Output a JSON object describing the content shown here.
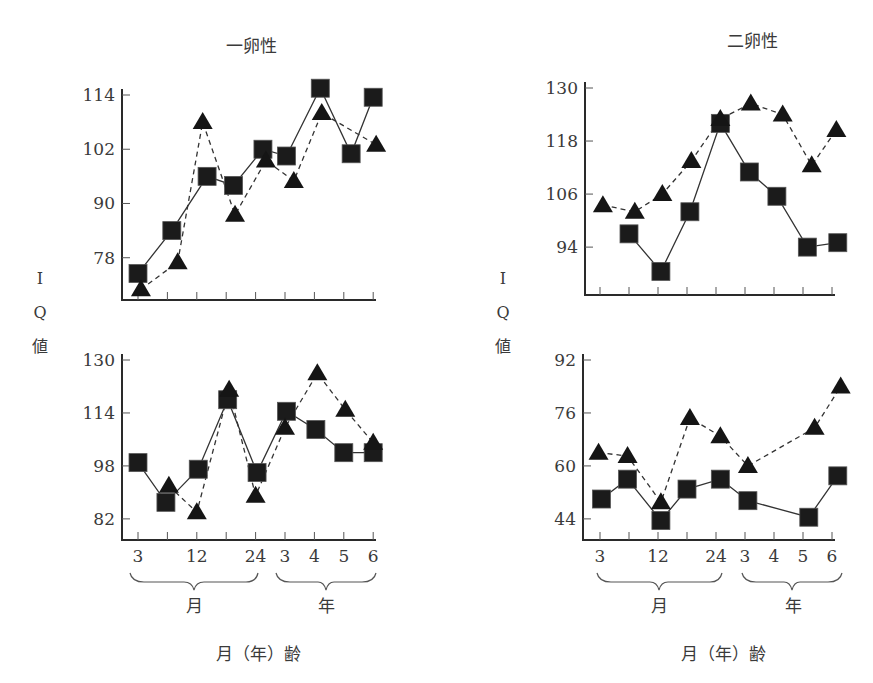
{
  "labels": {
    "ylabel_chars": [
      "I",
      "Q",
      "値"
    ],
    "xlabel": "月（年）齢",
    "group_months": "月",
    "group_years": "年"
  },
  "chart_data": [
    {
      "id": "top-left",
      "type": "line",
      "title": "一卵性",
      "xlabel": "月（年）齢",
      "ylabel": "IQ値",
      "x_tick_labels": [
        "",
        "",
        "",
        "",
        "",
        "",
        "",
        "",
        ""
      ],
      "x_positions": [
        "3m",
        "6m",
        "12m",
        "18m",
        "24m",
        "3y",
        "4y",
        "5y",
        "6y"
      ],
      "yticks": [
        78,
        90,
        102,
        114
      ],
      "ylim": [
        71,
        114
      ],
      "series": [
        {
          "name": "squares (solid)",
          "marker": "square",
          "line": "solid",
          "x": [
            0.0,
            1.15,
            2.35,
            3.25,
            4.25,
            5.05,
            6.2,
            7.25,
            8.0
          ],
          "values": [
            74.5,
            84,
            96,
            94,
            102,
            100.5,
            115.5,
            101,
            113.5
          ]
        },
        {
          "name": "triangles (dashed)",
          "marker": "triangle",
          "line": "dashed",
          "x": [
            0.1,
            1.35,
            2.2,
            3.3,
            4.35,
            5.3,
            6.25,
            8.1
          ],
          "values": [
            71,
            77,
            108,
            87.5,
            99.5,
            95,
            110,
            103
          ]
        }
      ]
    },
    {
      "id": "top-right",
      "type": "line",
      "title": "二卵性",
      "xlabel": "月（年）齢",
      "ylabel": "IQ値",
      "x_tick_labels": [
        "",
        "",
        "",
        "",
        "",
        "",
        "",
        "",
        ""
      ],
      "x_positions": [
        "3m",
        "6m",
        "12m",
        "18m",
        "24m",
        "3y",
        "4y",
        "5y",
        "6y"
      ],
      "yticks": [
        94,
        106,
        118,
        130
      ],
      "ylim": [
        84,
        130
      ],
      "series": [
        {
          "name": "squares (solid)",
          "marker": "square",
          "line": "solid",
          "x": [
            1.0,
            2.1,
            3.1,
            4.15,
            5.15,
            6.1,
            7.15,
            8.2
          ],
          "values": [
            97,
            88.5,
            102,
            122,
            111,
            105.5,
            94,
            95
          ]
        },
        {
          "name": "triangles (dashed)",
          "marker": "triangle",
          "line": "dashed",
          "x": [
            0.1,
            1.2,
            2.15,
            3.15,
            4.15,
            5.2,
            6.3,
            7.3,
            8.15
          ],
          "values": [
            103.5,
            102,
            106,
            113.5,
            123,
            126.5,
            124,
            112.5,
            120.5
          ]
        }
      ]
    },
    {
      "id": "bottom-left",
      "type": "line",
      "title": "",
      "xlabel": "月（年）齢",
      "ylabel": "IQ値",
      "x_tick_labels": [
        "3",
        "",
        "12",
        "",
        "24",
        "3",
        "4",
        "5",
        "6"
      ],
      "x_positions": [
        "3m",
        "6m",
        "12m",
        "18m",
        "24m",
        "3y",
        "4y",
        "5y",
        "6y"
      ],
      "yticks": [
        82,
        98,
        114,
        130
      ],
      "ylim": [
        76,
        130
      ],
      "series": [
        {
          "name": "squares (solid)",
          "marker": "square",
          "line": "solid",
          "x": [
            0.0,
            0.95,
            2.05,
            3.05,
            4.05,
            5.05,
            6.05,
            7.0,
            8.0
          ],
          "values": [
            99,
            87,
            97,
            118,
            96,
            114.5,
            109,
            102,
            102
          ]
        },
        {
          "name": "triangles (dashed)",
          "marker": "triangle",
          "line": "dashed",
          "x": [
            1.05,
            2.0,
            3.1,
            4.0,
            5.0,
            6.1,
            7.05,
            8.0
          ],
          "values": [
            92,
            84,
            121,
            89,
            109.5,
            126,
            115,
            105
          ]
        }
      ]
    },
    {
      "id": "bottom-right",
      "type": "line",
      "title": "",
      "xlabel": "月（年）齢",
      "ylabel": "IQ値",
      "x_tick_labels": [
        "3",
        "",
        "12",
        "",
        "24",
        "3",
        "4",
        "5",
        "6"
      ],
      "x_positions": [
        "3m",
        "6m",
        "12m",
        "18m",
        "24m",
        "3y",
        "4y",
        "5y",
        "6y"
      ],
      "yticks": [
        44,
        60,
        76,
        92
      ],
      "ylim": [
        38,
        92
      ],
      "series": [
        {
          "name": "squares (solid)",
          "marker": "square",
          "line": "solid",
          "x": [
            0.05,
            0.95,
            2.1,
            3.0,
            4.15,
            5.1,
            7.2,
            8.2
          ],
          "values": [
            50,
            56,
            43.5,
            53,
            56,
            49.5,
            44.5,
            57
          ]
        },
        {
          "name": "triangles (dashed)",
          "marker": "triangle",
          "line": "dashed",
          "x": [
            -0.05,
            0.95,
            2.1,
            3.1,
            4.15,
            5.1,
            7.4,
            8.3
          ],
          "values": [
            64,
            63,
            49,
            74.5,
            69,
            60,
            71.5,
            84
          ]
        }
      ]
    }
  ]
}
